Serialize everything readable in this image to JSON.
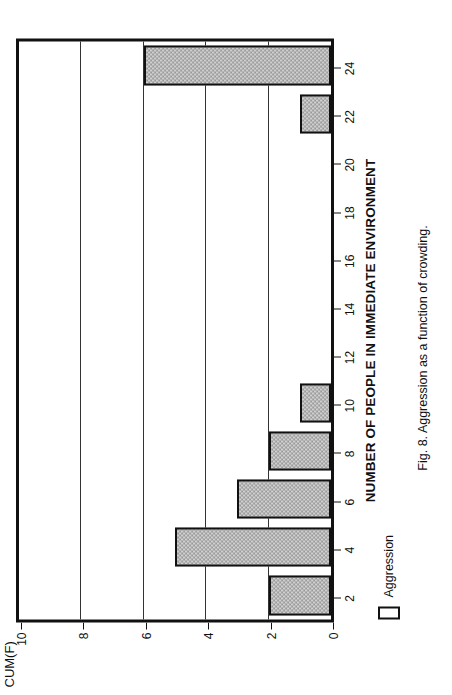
{
  "figure": {
    "caption": "Fig. 8.  Aggression as a function of crowding.",
    "orientation_note": "rotated"
  },
  "legend": {
    "position": "bottom-left",
    "entries": [
      {
        "label": "Aggression",
        "swatch": "open-rectangle"
      }
    ]
  },
  "chart_data": {
    "type": "bar",
    "title": "",
    "subtitle": "",
    "xlabel": "NUMBER OF PEOPLE IN IMMEDIATE ENVIRONMENT",
    "ylabel": "CUM(F)",
    "orientation": "vertical-bars-rendered-rotated",
    "categories": [
      2,
      4,
      6,
      8,
      10,
      12,
      14,
      16,
      18,
      20,
      22,
      24
    ],
    "category_labels": [
      "2",
      "4",
      "6",
      "8",
      "10",
      "12",
      "14",
      "16",
      "18",
      "20",
      "22",
      "24"
    ],
    "values": [
      2,
      5,
      3,
      2,
      1,
      0,
      0,
      0,
      0,
      0,
      1,
      6
    ],
    "series": [
      {
        "name": "Aggression",
        "values": [
          2,
          5,
          3,
          2,
          1,
          0,
          0,
          0,
          0,
          0,
          1,
          6
        ]
      }
    ],
    "xlim": [
      1,
      25
    ],
    "ylim": [
      0,
      10
    ],
    "xticks": [
      2,
      4,
      6,
      8,
      10,
      12,
      14,
      16,
      18,
      20,
      22,
      24
    ],
    "yticks": [
      0,
      2,
      4,
      6,
      8,
      10
    ],
    "ytick_labels": [
      "0",
      "2",
      "4",
      "6",
      "8",
      "10"
    ],
    "grid": "horizontal-only",
    "legend_position": "bottom-left",
    "bar_fill": "#cfcfcf",
    "bar_pattern": "checkered-gray",
    "bar_edge_color": "#111111",
    "frame_color": "#111111",
    "gridline_color": "#333333",
    "annotations": []
  }
}
